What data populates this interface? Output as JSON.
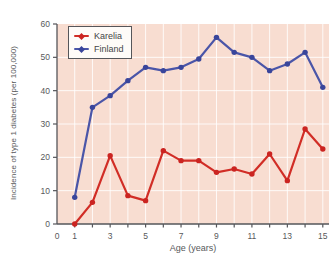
{
  "chart_data": {
    "type": "line",
    "title": "",
    "xlabel": "Age (years)",
    "ylabel": "Incidence of type 1 diabetes (per 100,000)",
    "x": [
      1,
      2,
      3,
      4,
      5,
      6,
      7,
      8,
      9,
      10,
      11,
      12,
      13,
      14,
      15
    ],
    "series": [
      {
        "name": "Karelia",
        "color": "#d12d26",
        "marker_color": "#cb2421",
        "values": [
          0,
          6.5,
          20.5,
          8.5,
          7,
          22,
          19,
          19,
          15.5,
          16.5,
          15,
          21,
          13,
          28.5,
          22.5
        ]
      },
      {
        "name": "Finland",
        "color": "#4a55a8",
        "marker_color": "#39459b",
        "values": [
          8,
          35,
          38.5,
          43,
          47,
          46,
          47,
          49.5,
          56,
          51.5,
          50,
          46,
          48,
          51.5,
          41
        ]
      }
    ],
    "xlim": [
      0,
      15.35
    ],
    "ylim": [
      0,
      60
    ],
    "x_ticks": [
      1,
      2,
      3,
      4,
      5,
      6,
      7,
      8,
      9,
      10,
      11,
      12,
      13,
      14,
      15
    ],
    "x_tick_labels": [
      {
        "pos": 0,
        "label": "0"
      },
      {
        "pos": 1,
        "label": "1"
      },
      {
        "pos": 3,
        "label": "3"
      },
      {
        "pos": 5,
        "label": "5"
      },
      {
        "pos": 7,
        "label": "7"
      },
      {
        "pos": 9,
        "label": "9"
      },
      {
        "pos": 11,
        "label": "11"
      },
      {
        "pos": 13,
        "label": "13"
      },
      {
        "pos": 15,
        "label": "15"
      }
    ],
    "y_ticks": [
      0,
      10,
      20,
      30,
      40,
      50,
      60
    ],
    "grid": {
      "vertical_at": [
        1,
        2,
        3,
        4,
        5,
        6,
        7,
        8,
        9,
        10,
        11,
        12,
        13,
        14,
        15
      ],
      "horizontal_at": [
        10,
        20,
        30,
        40,
        50
      ]
    },
    "legend_position": "top-left",
    "colors": {
      "plot_bg": "#f8ddd1",
      "grid": "#ffffff",
      "axis": "#55565a",
      "tick_text": "#58595b",
      "legend_bg": "#fefbf8",
      "legend_border": "#55565a"
    }
  }
}
